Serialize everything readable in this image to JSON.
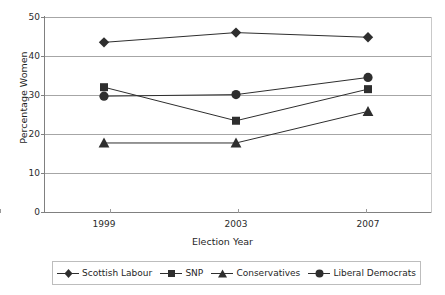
{
  "chart_data": {
    "type": "line",
    "title": "",
    "xlabel": "Election Year",
    "ylabel": "Percentage Women",
    "categories": [
      "1999",
      "2003",
      "2007"
    ],
    "x": [
      1999,
      2003,
      2007
    ],
    "ylim": [
      0,
      50
    ],
    "yticks": [
      0,
      10,
      20,
      30,
      40,
      50
    ],
    "ytick_labels": [
      "0",
      "10",
      "20",
      "30",
      "40",
      "50"
    ],
    "grid": "horizontal",
    "legend_position": "bottom",
    "series": [
      {
        "name": "Scottish Labour",
        "marker": "diamond",
        "color": "#2e2e2e",
        "values": [
          43.5,
          46.0,
          44.8
        ]
      },
      {
        "name": "SNP",
        "marker": "square",
        "color": "#2e2e2e",
        "values": [
          32.0,
          23.4,
          31.5
        ]
      },
      {
        "name": "Conservatives",
        "marker": "triangle",
        "color": "#2e2e2e",
        "values": [
          17.7,
          17.7,
          25.8
        ]
      },
      {
        "name": "Liberal Democrats",
        "marker": "circle",
        "color": "#2e2e2e",
        "values": [
          29.7,
          30.1,
          34.5
        ]
      }
    ]
  },
  "axes": {
    "y_title": "Percentage Women",
    "x_title": "Election Year",
    "y_tick_labels": [
      "50",
      "40",
      "30",
      "20",
      "10",
      "0"
    ],
    "x_tick_labels": [
      "1999",
      "2003",
      "2007"
    ]
  },
  "legend": {
    "items": [
      {
        "label": "Scottish Labour",
        "marker": "diamond-marker"
      },
      {
        "label": "SNP",
        "marker": "square-marker"
      },
      {
        "label": "Conservatives",
        "marker": "triangle-marker"
      },
      {
        "label": "Liberal Democrats",
        "marker": "circle-marker"
      }
    ]
  },
  "colors": {
    "series": "#2e2e2e",
    "gridline": "#a6a6a6",
    "axis": "#808080",
    "text": "#1f1f1f",
    "background": "#ffffff"
  }
}
